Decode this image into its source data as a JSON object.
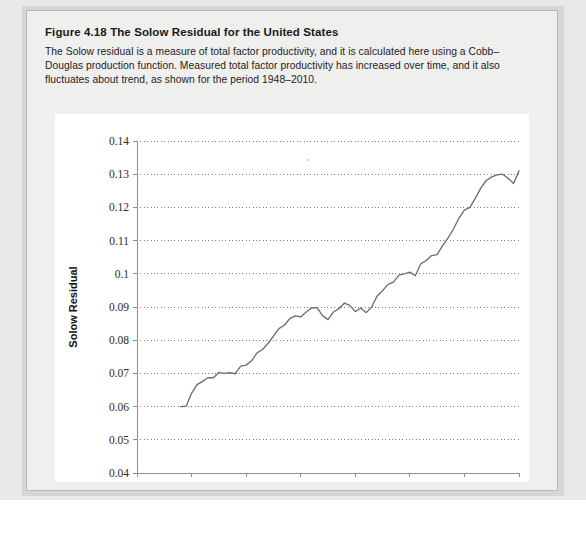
{
  "figure": {
    "label": "Figure 4.18",
    "title": "The Solow Residual for the United States",
    "caption": "The Solow residual is a measure of total factor productivity, and it is calculated here using a Cobb–Douglas production function. Measured total factor productivity has increased over time, and it also fluctuates about trend, as shown for the period 1948–2010."
  },
  "chart_data": {
    "type": "line",
    "title": "The Solow Residual for the United States",
    "xlabel": "Year",
    "ylabel": "Solow Residual",
    "xlim": [
      1940,
      2010
    ],
    "ylim": [
      0.04,
      0.14
    ],
    "xticks": [
      1940,
      1950,
      1960,
      1970,
      1980,
      1990,
      2000,
      2010
    ],
    "xticklabels": [
      "1940",
      "1950",
      "1960",
      "1970",
      "1980",
      "1990",
      "2000",
      "2010"
    ],
    "yticks": [
      0.04,
      0.05,
      0.06,
      0.07,
      0.08,
      0.09,
      0.1,
      0.11,
      0.12,
      0.13,
      0.14
    ],
    "yticklabels": [
      "0.04",
      "0.05",
      "0.06",
      "0.07",
      "0.08",
      "0.09",
      "0.1",
      "0.11",
      "0.12",
      "0.13",
      "0.14"
    ],
    "grid": "horizontal-dotted",
    "legend": "none",
    "line_color": "#6e6e6e",
    "series": [
      {
        "name": "Solow Residual",
        "x": [
          1948,
          1949,
          1950,
          1951,
          1952,
          1953,
          1954,
          1955,
          1956,
          1957,
          1958,
          1959,
          1960,
          1961,
          1962,
          1963,
          1964,
          1965,
          1966,
          1967,
          1968,
          1969,
          1970,
          1971,
          1972,
          1973,
          1974,
          1975,
          1976,
          1977,
          1978,
          1979,
          1980,
          1981,
          1982,
          1983,
          1984,
          1985,
          1986,
          1987,
          1988,
          1989,
          1990,
          1991,
          1992,
          1993,
          1994,
          1995,
          1996,
          1997,
          1998,
          1999,
          2000,
          2001,
          2002,
          2003,
          2004,
          2005,
          2006,
          2007,
          2008,
          2009,
          2010
        ],
        "values": [
          0.06,
          0.0601,
          0.064,
          0.0666,
          0.0676,
          0.0687,
          0.0687,
          0.0703,
          0.07,
          0.0702,
          0.0699,
          0.0722,
          0.0725,
          0.0738,
          0.0762,
          0.0772,
          0.079,
          0.0812,
          0.0835,
          0.0845,
          0.0865,
          0.0873,
          0.087,
          0.0885,
          0.0897,
          0.0898,
          0.0874,
          0.0862,
          0.0885,
          0.0895,
          0.0912,
          0.0905,
          0.0886,
          0.0897,
          0.0883,
          0.09,
          0.0933,
          0.0949,
          0.0968,
          0.0975,
          0.0996,
          0.1,
          0.1005,
          0.0994,
          0.103,
          0.104,
          0.1055,
          0.1058,
          0.1085,
          0.1108,
          0.1135,
          0.1168,
          0.1192,
          0.12,
          0.1228,
          0.1258,
          0.1281,
          0.1292,
          0.1298,
          0.13,
          0.1288,
          0.1272,
          0.131
        ]
      }
    ]
  }
}
